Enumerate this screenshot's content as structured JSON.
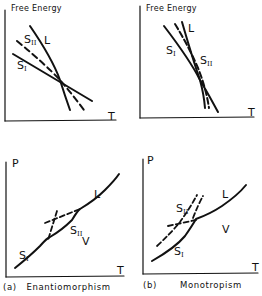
{
  "panels": {
    "top_left": {
      "y_axis_label": "Free Energy",
      "x_axis_label": "T",
      "curves": {
        "L": "L",
        "S2": "S",
        "S2_sub": "II",
        "S1": "S",
        "S1_sub": "I"
      }
    },
    "top_right": {
      "y_axis_label": "Free Energy",
      "x_axis_label": "T",
      "curves": {
        "L": "L",
        "S1": "S",
        "S1_sub": "I",
        "S2": "S",
        "S2_sub": "II"
      }
    },
    "bottom_left": {
      "y_axis_label": "P",
      "x_axis_label": "T",
      "regions": {
        "L": "L",
        "V": "V",
        "S2": "S",
        "S2_sub": "II",
        "S1": "S",
        "S1_sub": "I"
      },
      "caption_tag": "(a)",
      "caption": "Enantiomorphism"
    },
    "bottom_right": {
      "y_axis_label": "P",
      "x_axis_label": "T",
      "regions": {
        "L": "L",
        "V": "V",
        "S2": "S",
        "S2_sub": "II",
        "S1": "S",
        "S1_sub": "I"
      },
      "caption_tag": "(b)",
      "caption": "Monotropism"
    }
  },
  "colors": {
    "ink": "#111111",
    "background": "#ffffff"
  }
}
